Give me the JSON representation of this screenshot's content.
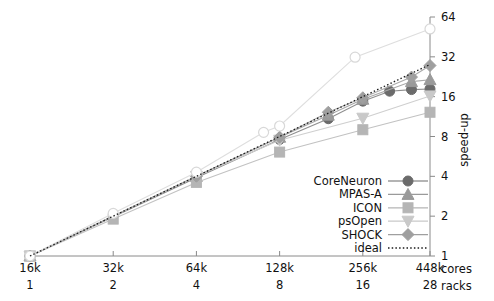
{
  "chart_data": {
    "type": "line",
    "title": "",
    "xlabel": "cores",
    "ylabel": "speed-up",
    "x_secondary_label": "racks",
    "grid": false,
    "legend_position": "bottom-right",
    "x_scale": "log2",
    "y_scale": "log2",
    "xlim": [
      16384,
      458752
    ],
    "ylim": [
      1,
      64
    ],
    "x_ticks": [
      {
        "cores": "16k",
        "racks": "1",
        "value": 16384
      },
      {
        "cores": "32k",
        "racks": "2",
        "value": 32768
      },
      {
        "cores": "64k",
        "racks": "4",
        "value": 65536
      },
      {
        "cores": "128k",
        "racks": "8",
        "value": 131072
      },
      {
        "cores": "256k",
        "racks": "16",
        "value": 262144
      },
      {
        "cores": "448k",
        "racks": "28",
        "value": 458752
      }
    ],
    "y_ticks": [
      "1",
      "2",
      "4",
      "8",
      "16",
      "32",
      "64"
    ],
    "y_tick_values": [
      1,
      2,
      4,
      8,
      16,
      32,
      64
    ],
    "series": [
      {
        "name": "CoreNeuron",
        "marker": "circle-filled",
        "color": "#6b6b6b",
        "line_color": "#8f8f8f",
        "x": [
          16384,
          65536,
          131072,
          196608,
          262144,
          327680,
          393216,
          458752
        ],
        "y": [
          1.0,
          3.9,
          7.6,
          10.9,
          14.8,
          17.6,
          18.1,
          18.3
        ]
      },
      {
        "name": "MPAS-A",
        "marker": "triangle-up",
        "color": "#9a9a9a",
        "line_color": "#a8a8a8",
        "x": [
          16384,
          65536,
          131072,
          196608,
          262144,
          393216,
          458752
        ],
        "y": [
          1.0,
          4.0,
          7.9,
          11.6,
          15.3,
          20.8,
          21.5
        ]
      },
      {
        "name": "ICON",
        "marker": "square",
        "color": "#b5b5b5",
        "line_color": "#c2c2c2",
        "x": [
          16384,
          32768,
          65536,
          131072,
          262144,
          458752
        ],
        "y": [
          1.0,
          1.9,
          3.6,
          6.1,
          9.0,
          12.2
        ]
      },
      {
        "name": "psOpen",
        "marker": "triangle-down",
        "color": "#c9c9c9",
        "line_color": "#cfcfcf",
        "x": [
          16384,
          65536,
          131072,
          262144,
          458752
        ],
        "y": [
          1.0,
          4.0,
          7.5,
          11.0,
          16.2
        ]
      },
      {
        "name": "SHOCK",
        "marker": "diamond",
        "color": "#9f9f9f",
        "line_color": "#ababab",
        "x": [
          16384,
          65536,
          131072,
          196608,
          262144,
          393216,
          458752
        ],
        "y": [
          1.0,
          4.0,
          7.9,
          12.2,
          15.7,
          22.5,
          27.5
        ]
      },
      {
        "name": "super-linear",
        "marker": "circle-open",
        "color": "#d8d8d8",
        "line_color": "#dedede",
        "x": [
          16384,
          32768,
          65536,
          114688,
          131072,
          245760,
          458752
        ],
        "y": [
          1.0,
          2.1,
          4.3,
          8.6,
          9.6,
          31.8,
          52.0
        ],
        "in_legend": false
      },
      {
        "name": "ideal",
        "marker": "none",
        "line_style": "dotted",
        "color": "#1a1a1a",
        "line_color": "#1a1a1a",
        "x": [
          16384,
          458752
        ],
        "y": [
          1.0,
          28.0
        ]
      }
    ],
    "legend": [
      {
        "label": "CoreNeuron",
        "marker": "circle-filled",
        "color": "#6b6b6b"
      },
      {
        "label": "MPAS-A",
        "marker": "triangle-up",
        "color": "#9a9a9a"
      },
      {
        "label": "ICON",
        "marker": "square",
        "color": "#b5b5b5"
      },
      {
        "label": "psOpen",
        "marker": "triangle-down",
        "color": "#c9c9c9"
      },
      {
        "label": "SHOCK",
        "marker": "diamond",
        "color": "#9f9f9f"
      },
      {
        "label": "ideal",
        "marker": "dotted-line",
        "color": "#1a1a1a"
      }
    ]
  },
  "axes": {
    "y_axis_title": "speed-up",
    "x_axis_row1_title": "cores",
    "x_axis_row2_title": "racks"
  },
  "colors": {
    "axis": "#8a8a8a",
    "text": "#111111",
    "background": "#ffffff"
  }
}
